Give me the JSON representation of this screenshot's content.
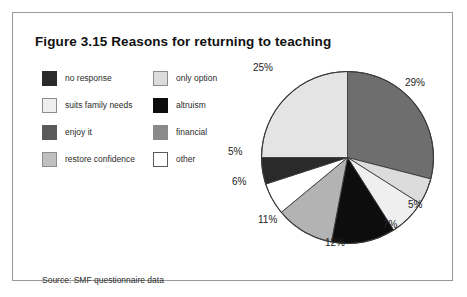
{
  "figure": {
    "title": "Figure 3.15 Reasons for returning to teaching",
    "source": "Source: SMF questionnaire data",
    "frame_color": "#9a9a9a",
    "background": "#ffffff"
  },
  "legend": {
    "columns": [
      {
        "items": [
          {
            "label": "no response",
            "color": "#2a2a2a",
            "border": "#2a2a2a"
          },
          {
            "label": "suits family needs",
            "color": "#efefef",
            "border": "#8d8d8d"
          },
          {
            "label": "enjoy it",
            "color": "#5a5a5a",
            "border": "#5a5a5a"
          },
          {
            "label": "restore confidence",
            "color": "#c0c0c0",
            "border": "#8d8d8d"
          }
        ]
      },
      {
        "items": [
          {
            "label": "only option",
            "color": "#dcdcdc",
            "border": "#8d8d8d"
          },
          {
            "label": "altruism",
            "color": "#0d0d0d",
            "border": "#0d0d0d"
          },
          {
            "label": "financial",
            "color": "#8a8a8a",
            "border": "#8a8a8a"
          },
          {
            "label": "other",
            "color": "#ffffff",
            "border": "#5a5a5a"
          }
        ]
      }
    ]
  },
  "chart_data": {
    "type": "pie",
    "title": "Figure 3.15 Reasons for returning to teaching",
    "xlabel": "",
    "ylabel": "",
    "legend_position": "left",
    "grid": false,
    "start_angle_deg": 0,
    "direction": "clockwise",
    "categories": [
      "enjoy it",
      "only option",
      "suits family needs",
      "altruism",
      "restore confidence",
      "other",
      "no response",
      "financial"
    ],
    "values": [
      29,
      5,
      7,
      12,
      11,
      6,
      5,
      25
    ],
    "slices": [
      {
        "label": "enjoy it",
        "value": 29,
        "display": "29%",
        "color": "#6e6e6e",
        "label_x": 405,
        "label_y": 78
      },
      {
        "label": "only option",
        "value": 5,
        "display": "5%",
        "color": "#dcdcdc",
        "label_x": 408,
        "label_y": 200
      },
      {
        "label": "suits family needs",
        "value": 7,
        "display": "7%",
        "color": "#efefef",
        "label_x": 383,
        "label_y": 220
      },
      {
        "label": "altruism",
        "value": 12,
        "display": "12%",
        "color": "#0d0d0d",
        "label_x": 325,
        "label_y": 238
      },
      {
        "label": "restore confidence",
        "value": 11,
        "display": "11%",
        "color": "#b3b3b3",
        "label_x": 258,
        "label_y": 215
      },
      {
        "label": "other",
        "value": 6,
        "display": "6%",
        "color": "#ffffff",
        "label_x": 232,
        "label_y": 177
      },
      {
        "label": "no response",
        "value": 5,
        "display": "5%",
        "color": "#2a2a2a",
        "label_x": 228,
        "label_y": 147
      },
      {
        "label": "financial",
        "value": 25,
        "display": "25%",
        "color": "#e4e4e4",
        "label_x": 253,
        "label_y": 63
      }
    ],
    "total": 100,
    "units": "percent"
  }
}
